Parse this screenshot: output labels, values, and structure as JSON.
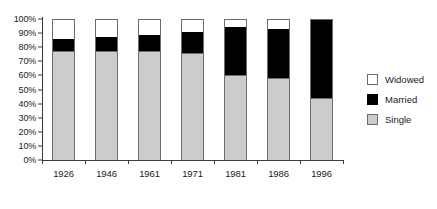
{
  "chart_data": {
    "type": "bar",
    "subtype": "stacked-percentage-column",
    "title": "",
    "subtitle": "",
    "xlabel": "",
    "ylabel": "",
    "categories": [
      "1926",
      "1946",
      "1961",
      "1971",
      "1981",
      "1986",
      "1996"
    ],
    "ylim": [
      0,
      100
    ],
    "y_tick_labels": [
      "100%",
      "90%",
      "80%",
      "70%",
      "60%",
      "50%",
      "40%",
      "30%",
      "20%",
      "10%",
      "0%"
    ],
    "y_tick_values": [
      100,
      90,
      80,
      70,
      60,
      50,
      40,
      30,
      20,
      10,
      0
    ],
    "y_unit": "%",
    "grid": false,
    "legend_position": "right",
    "legend": [
      "Widowed",
      "Married",
      "Single"
    ],
    "series": [
      {
        "name": "Single",
        "color": "#cccccc",
        "values": [
          77,
          77,
          77,
          76,
          60,
          58,
          44
        ]
      },
      {
        "name": "Married",
        "color": "#000000",
        "values": [
          9,
          10,
          12,
          15,
          34,
          35,
          55
        ]
      },
      {
        "name": "Widowed",
        "color": "#ffffff",
        "values": [
          14,
          13,
          11,
          9,
          6,
          7,
          1
        ]
      }
    ],
    "stack_order_bottom_to_top": [
      "Single",
      "Married",
      "Widowed"
    ],
    "cumulative_tops": {
      "Single": [
        77,
        77,
        77,
        76,
        60,
        58,
        44
      ],
      "Married": [
        86,
        87,
        89,
        91,
        94,
        93,
        99
      ],
      "Widowed": [
        100,
        100,
        100,
        100,
        100,
        100,
        100
      ]
    }
  },
  "legend": {
    "items": [
      {
        "label": "Widowed",
        "swatch": "white-square-swatch"
      },
      {
        "label": "Married",
        "swatch": "black-square-swatch"
      },
      {
        "label": "Single",
        "swatch": "gray-square-swatch"
      }
    ]
  },
  "colors": {
    "single": "#cccccc",
    "married": "#000000",
    "widowed": "#ffffff",
    "axis": "#3a3a3a",
    "outline": "#6e6e6e",
    "text": "#1a1a1a",
    "background": "#ffffff"
  }
}
